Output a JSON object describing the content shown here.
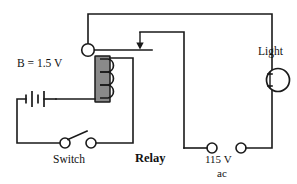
{
  "figure": {
    "type": "electrical-circuit-schematic"
  },
  "labels": {
    "battery": "B = 1.5 V",
    "switch": "Switch",
    "relay": "Relay",
    "light": "Light",
    "supply_volts": "115 V",
    "supply_type": "ac"
  },
  "components": [
    {
      "name": "battery",
      "label": "B = 1.5 V",
      "voltage": "1.5 V"
    },
    {
      "name": "switch",
      "label": "Switch",
      "state": "open"
    },
    {
      "name": "relay",
      "label": "Relay",
      "coil_turns": 3
    },
    {
      "name": "light",
      "label": "Light"
    },
    {
      "name": "ac-supply",
      "label": "115 V ac",
      "voltage": "115 V",
      "current_type": "ac"
    }
  ],
  "colors": {
    "line": "#1a1a1a",
    "core_fill": "#8a8a8a",
    "background": "#ffffff"
  }
}
